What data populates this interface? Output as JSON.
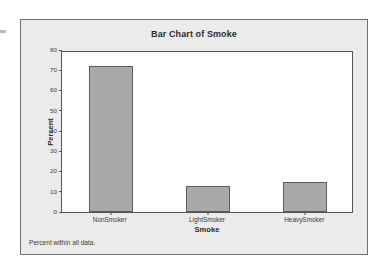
{
  "panel": {
    "background_color": "#ebebeb",
    "border_color": "#6e6e6e"
  },
  "footnote": "Percent within all data.",
  "chart_data": {
    "type": "bar",
    "title": "Bar Chart of Smoke",
    "xlabel": "Smoke",
    "ylabel": "Percent",
    "categories": [
      "NonSmoker",
      "LightSmoker",
      "HeavySmoker"
    ],
    "values": [
      72,
      13,
      15
    ],
    "ylim": [
      0,
      80
    ],
    "yticks": [
      0,
      10,
      20,
      30,
      40,
      50,
      60,
      70,
      80
    ],
    "ytick_labels": [
      "0",
      "10",
      "20",
      "30",
      "40",
      "50",
      "60",
      "70",
      "80"
    ],
    "grid": false,
    "legend": null,
    "bar_fill_color": "#a9a9a9",
    "bar_border_color": "#5c5c5c",
    "plot_background_color": "#ffffff",
    "axis_color": "#555555"
  }
}
